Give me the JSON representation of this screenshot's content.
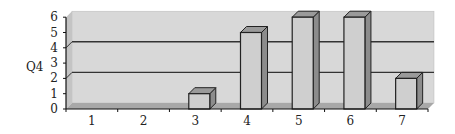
{
  "chart_data": {
    "type": "bar",
    "style": "3d-column",
    "title": "",
    "xlabel": "",
    "ylabel": "Q4",
    "categories": [
      "1",
      "2",
      "3",
      "4",
      "5",
      "6",
      "7"
    ],
    "values": [
      0,
      0,
      1,
      5,
      6,
      6,
      2
    ],
    "ylim": [
      0,
      6
    ],
    "yticks": [
      "0",
      "1",
      "2",
      "3",
      "4",
      "5",
      "6"
    ],
    "gridlines": [
      2,
      4
    ],
    "grid": true,
    "legend": "none"
  },
  "colors": {
    "wall": "#d8d8d8",
    "floor": "#a8a8a8",
    "bar_front": "#cfcfcf",
    "bar_side": "#8c8c8c",
    "bar_top": "#9a9a9a",
    "outline": "#222222",
    "gridline": "#333333"
  }
}
